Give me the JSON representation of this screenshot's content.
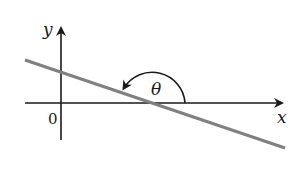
{
  "diagram": {
    "type": "coordinate-plane-angle",
    "labels": {
      "y_axis": "y",
      "x_axis": "x",
      "origin": "0",
      "angle": "θ"
    },
    "colors": {
      "axes": "#1a1a1a",
      "line": "#808080",
      "background": "#ffffff"
    },
    "elements": {
      "line": {
        "description": "straight line with negative slope crossing the x-axis to the right of the origin"
      },
      "angle_arc": {
        "description": "arc measured counterclockwise from positive x-direction to the line, indicating an obtuse inclination angle θ"
      }
    }
  }
}
